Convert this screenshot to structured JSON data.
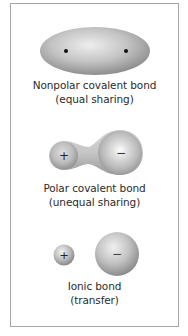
{
  "diagram": {
    "panels": [
      {
        "id": "nonpolar",
        "title": "Nonpolar covalent bond",
        "subtitle": "(equal sharing)",
        "symbols": []
      },
      {
        "id": "polar",
        "title": "Polar covalent bond",
        "subtitle": "(unequal sharing)",
        "symbols": [
          "+",
          "−"
        ]
      },
      {
        "id": "ionic",
        "title": "Ionic bond",
        "subtitle": "(transfer)",
        "symbols": [
          "+",
          "−"
        ]
      }
    ],
    "colors": {
      "border": "#a6a6a6",
      "shape_light": "#efefef",
      "shape_mid": "#c2c2c2",
      "shape_dark": "#8f8f8f",
      "text": "#2b2b2b"
    }
  }
}
